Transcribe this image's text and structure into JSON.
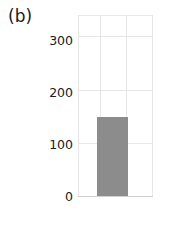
{
  "figure": {
    "panel_label": "(b)",
    "background_color": "#ffffff",
    "width": 181,
    "height": 226
  },
  "chart_data": {
    "type": "bar",
    "title": "",
    "subtitle": "",
    "panel_label": "(b)",
    "xlabel": "",
    "ylabel": "",
    "categories": [
      ""
    ],
    "values": [
      150
    ],
    "series": [
      {
        "name": "",
        "values": [
          150
        ],
        "color": "#8c8c8c"
      }
    ],
    "ylim": [
      0,
      340
    ],
    "yticks": [
      0,
      100,
      200,
      300
    ],
    "ytick_labels": [
      "0",
      "100",
      "200",
      "300"
    ],
    "xticks": [],
    "xtick_labels": [],
    "grid": true,
    "grid_color": "#e6e6e6",
    "legend": false,
    "legend_position": "none",
    "bar_color": "#8c8c8c",
    "annotations": []
  },
  "axis": {
    "tick0": "0",
    "tick1": "100",
    "tick2": "200",
    "tick3": "300"
  }
}
